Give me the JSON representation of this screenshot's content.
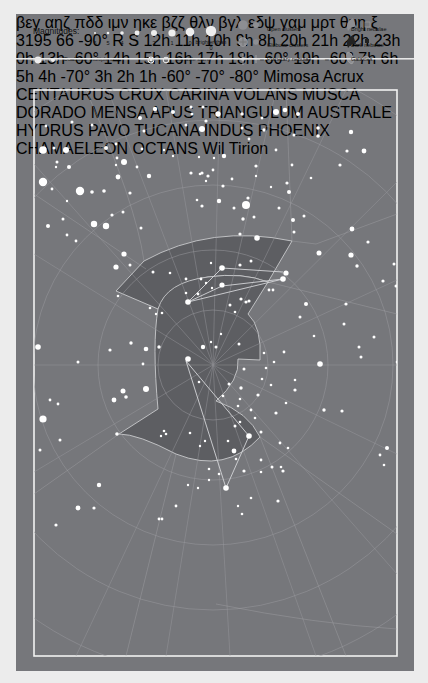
{
  "legend": {
    "magnitudes_label": "Magnitudes:",
    "magnitudes": [
      "6",
      "5",
      "4",
      "3",
      "2",
      "1",
      "0",
      "brighter than 0"
    ],
    "double_stars": "Double or multiple stars",
    "variable_stars": "Variable stars",
    "open_clusters": "Open clusters",
    "globular_clusters": "Globular clusters",
    "planetary_nebulae": "Planetary nebulae",
    "bright_nebulae": "Bright nebulae",
    "dark_nebulae": "Dark nebulae",
    "galaxies": "Galaxies"
  },
  "top_ra_labels": [
    "12h",
    "11h",
    "10h",
    "9h",
    "8h"
  ],
  "bottom_ra_labels": [
    "20h",
    "21h",
    "22h",
    "23h",
    "0h"
  ],
  "left_labels": [
    "13h",
    "-60°",
    "14h",
    "15h",
    "16h",
    "17h",
    "18h",
    "-60°",
    "19h"
  ],
  "right_labels": [
    "-60°",
    "7h",
    "6h",
    "5h",
    "4h",
    "-70°",
    "3h",
    "2h",
    "1h",
    "-60°",
    "-70°"
  ],
  "grid_labels": [
    "-80°",
    "-90°",
    "-70°"
  ],
  "constellations": {
    "highlighted": [
      "CHAMAELEON",
      "OCTANS"
    ],
    "others": [
      "CENTAURUS",
      "CRUX",
      "CARINA",
      "VOLANS",
      "MUSCA",
      "DORADO",
      "MENSA",
      "APUS",
      "TRIANGULUM",
      "AUSTRALE",
      "HYDRUS",
      "PAVO",
      "TUCANA",
      "INDUS",
      "PHOENIX"
    ]
  },
  "star_names": [
    "Mimosa",
    "Acrux"
  ],
  "objects": [
    "3195",
    "δ",
    "ε",
    "β",
    "α",
    "γ",
    "θ",
    "η",
    "ι",
    "κ",
    "μ",
    "ν",
    "π",
    "ρ",
    "σ",
    "τ",
    "χ",
    "ψ",
    "ζ",
    "ξ",
    "ω",
    "φ",
    "λ",
    "δ",
    "R",
    "S",
    "μ1",
    "μ2"
  ],
  "credit": "Wil Tirion",
  "colors": {
    "background": "#76777b",
    "page": "#ececec",
    "region": "#5d5e62",
    "lines": "#a6a7aa",
    "stars": "#ffffff",
    "highlight_label": "#d8d8d8"
  }
}
